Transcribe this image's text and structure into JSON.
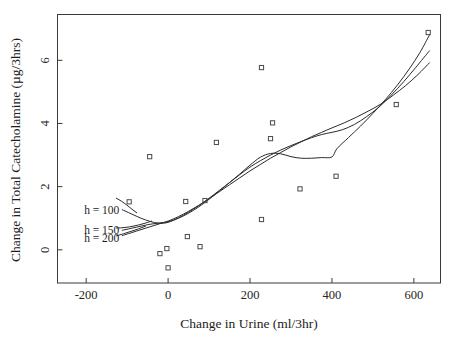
{
  "chart_data": {
    "type": "scatter",
    "title": "",
    "xlabel": "Change in Urine (ml/3hr)",
    "ylabel": "Change in Total Catecholamine (µg/3hrs)",
    "xlim": [
      -270,
      665
    ],
    "ylim": [
      -1.05,
      7.45
    ],
    "xticks": [
      -200,
      0,
      200,
      400,
      600
    ],
    "xticklabels": [
      "-200",
      "0",
      "200",
      "400",
      "600"
    ],
    "yticks": [
      0,
      2,
      4,
      6
    ],
    "yticklabels": [
      "0",
      "2",
      "4",
      "6"
    ],
    "grid": false,
    "legend_position": "inside-left",
    "marker": "open-square",
    "points": [
      {
        "x": -95,
        "y": 1.52
      },
      {
        "x": -45,
        "y": 2.95
      },
      {
        "x": -20,
        "y": -0.12
      },
      {
        "x": -3,
        "y": 0.04
      },
      {
        "x": 0,
        "y": -0.57
      },
      {
        "x": 43,
        "y": 1.53
      },
      {
        "x": 47,
        "y": 0.42
      },
      {
        "x": 78,
        "y": 0.1
      },
      {
        "x": 90,
        "y": 1.56
      },
      {
        "x": 118,
        "y": 3.4
      },
      {
        "x": 228,
        "y": 5.77
      },
      {
        "x": 228,
        "y": 0.96
      },
      {
        "x": 250,
        "y": 3.52
      },
      {
        "x": 255,
        "y": 4.02
      },
      {
        "x": 322,
        "y": 1.93
      },
      {
        "x": 410,
        "y": 2.33
      },
      {
        "x": 557,
        "y": 4.6
      },
      {
        "x": 635,
        "y": 6.88
      }
    ],
    "series": [
      {
        "name": "h = 100",
        "bandwidth": 100,
        "points": [
          {
            "x": -112,
            "y": 1.27
          },
          {
            "x": -90,
            "y": 1.14
          },
          {
            "x": -66,
            "y": 1.0
          },
          {
            "x": -44,
            "y": 0.9
          },
          {
            "x": -22,
            "y": 0.84
          },
          {
            "x": 0,
            "y": 0.87
          },
          {
            "x": 25,
            "y": 1.01
          },
          {
            "x": 50,
            "y": 1.19
          },
          {
            "x": 75,
            "y": 1.4
          },
          {
            "x": 100,
            "y": 1.63
          },
          {
            "x": 125,
            "y": 1.88
          },
          {
            "x": 150,
            "y": 2.13
          },
          {
            "x": 175,
            "y": 2.4
          },
          {
            "x": 200,
            "y": 2.68
          },
          {
            "x": 225,
            "y": 2.93
          },
          {
            "x": 250,
            "y": 3.05
          },
          {
            "x": 275,
            "y": 3.04
          },
          {
            "x": 300,
            "y": 2.95
          },
          {
            "x": 325,
            "y": 2.9
          },
          {
            "x": 350,
            "y": 2.9
          },
          {
            "x": 375,
            "y": 2.92
          },
          {
            "x": 400,
            "y": 2.94
          },
          {
            "x": 412,
            "y": 3.2
          },
          {
            "x": 440,
            "y": 3.55
          },
          {
            "x": 470,
            "y": 3.92
          },
          {
            "x": 500,
            "y": 4.32
          },
          {
            "x": 530,
            "y": 4.75
          },
          {
            "x": 560,
            "y": 5.22
          },
          {
            "x": 590,
            "y": 5.75
          },
          {
            "x": 615,
            "y": 6.25
          },
          {
            "x": 638,
            "y": 6.8
          }
        ]
      },
      {
        "name": "h = 150",
        "bandwidth": 150,
        "points": [
          {
            "x": -112,
            "y": 0.62
          },
          {
            "x": -90,
            "y": 0.68
          },
          {
            "x": -66,
            "y": 0.75
          },
          {
            "x": -44,
            "y": 0.81
          },
          {
            "x": -22,
            "y": 0.85
          },
          {
            "x": 0,
            "y": 0.89
          },
          {
            "x": 25,
            "y": 1.0
          },
          {
            "x": 50,
            "y": 1.16
          },
          {
            "x": 75,
            "y": 1.36
          },
          {
            "x": 100,
            "y": 1.6
          },
          {
            "x": 125,
            "y": 1.86
          },
          {
            "x": 150,
            "y": 2.13
          },
          {
            "x": 175,
            "y": 2.38
          },
          {
            "x": 200,
            "y": 2.62
          },
          {
            "x": 225,
            "y": 2.82
          },
          {
            "x": 250,
            "y": 3.0
          },
          {
            "x": 275,
            "y": 3.16
          },
          {
            "x": 300,
            "y": 3.3
          },
          {
            "x": 325,
            "y": 3.43
          },
          {
            "x": 350,
            "y": 3.55
          },
          {
            "x": 375,
            "y": 3.65
          },
          {
            "x": 400,
            "y": 3.72
          },
          {
            "x": 425,
            "y": 3.8
          },
          {
            "x": 455,
            "y": 3.97
          },
          {
            "x": 485,
            "y": 4.22
          },
          {
            "x": 515,
            "y": 4.52
          },
          {
            "x": 545,
            "y": 4.9
          },
          {
            "x": 575,
            "y": 5.32
          },
          {
            "x": 605,
            "y": 5.78
          },
          {
            "x": 638,
            "y": 6.3
          }
        ]
      },
      {
        "name": "h = 200",
        "bandwidth": 200,
        "points": [
          {
            "x": -112,
            "y": 0.45
          },
          {
            "x": -90,
            "y": 0.54
          },
          {
            "x": -66,
            "y": 0.64
          },
          {
            "x": -44,
            "y": 0.73
          },
          {
            "x": -22,
            "y": 0.82
          },
          {
            "x": 0,
            "y": 0.91
          },
          {
            "x": 25,
            "y": 1.05
          },
          {
            "x": 50,
            "y": 1.22
          },
          {
            "x": 75,
            "y": 1.41
          },
          {
            "x": 100,
            "y": 1.62
          },
          {
            "x": 125,
            "y": 1.84
          },
          {
            "x": 150,
            "y": 2.06
          },
          {
            "x": 175,
            "y": 2.28
          },
          {
            "x": 200,
            "y": 2.5
          },
          {
            "x": 225,
            "y": 2.7
          },
          {
            "x": 250,
            "y": 2.9
          },
          {
            "x": 275,
            "y": 3.08
          },
          {
            "x": 300,
            "y": 3.26
          },
          {
            "x": 325,
            "y": 3.42
          },
          {
            "x": 350,
            "y": 3.58
          },
          {
            "x": 375,
            "y": 3.72
          },
          {
            "x": 400,
            "y": 3.86
          },
          {
            "x": 430,
            "y": 4.02
          },
          {
            "x": 460,
            "y": 4.2
          },
          {
            "x": 490,
            "y": 4.4
          },
          {
            "x": 520,
            "y": 4.62
          },
          {
            "x": 550,
            "y": 4.9
          },
          {
            "x": 580,
            "y": 5.2
          },
          {
            "x": 610,
            "y": 5.55
          },
          {
            "x": 638,
            "y": 5.92
          }
        ]
      }
    ],
    "annotations": [
      {
        "label": "h = 100",
        "x": -205,
        "y": 1.25
      },
      {
        "label": "h = 150",
        "x": -205,
        "y": 0.62
      },
      {
        "label": "h = 200",
        "x": -205,
        "y": 0.38
      }
    ],
    "colors": {
      "curve": "#2b2b2b",
      "marker": "#4a4a4a",
      "axis": "#3a3a3a",
      "text": "#1c1c1c",
      "background": "#ffffff"
    }
  }
}
